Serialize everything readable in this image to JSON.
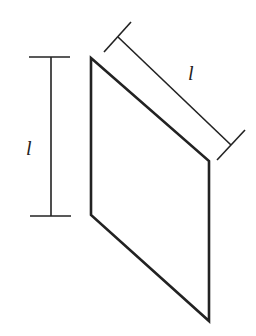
{
  "diagram": {
    "type": "geometry",
    "stroke_color": "#222222",
    "background": "#ffffff",
    "shape": {
      "name": "parallelogram",
      "vertices": [
        [
          91,
          58
        ],
        [
          209,
          161
        ],
        [
          209,
          321
        ],
        [
          91,
          215
        ]
      ]
    },
    "dimensions": [
      {
        "name": "vertical-side-dimension",
        "label": "l",
        "from": [
          51,
          57
        ],
        "to": [
          51,
          216
        ],
        "label_pos": [
          27,
          155
        ]
      },
      {
        "name": "slanted-side-dimension",
        "label": "l",
        "from": [
          118,
          37
        ],
        "to": [
          231,
          145
        ],
        "label_pos": [
          189,
          80
        ]
      }
    ]
  }
}
